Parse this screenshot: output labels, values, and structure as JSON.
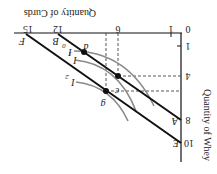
{
  "diagram": {
    "orientation": "rotated-180",
    "x_axis": {
      "title": "Quantity of Curds",
      "ticks": [
        "0",
        "1",
        "6",
        "12",
        "15"
      ]
    },
    "y_axis": {
      "title": "Quantity of Whey",
      "ticks": [
        "1",
        "4",
        "8",
        "10"
      ]
    },
    "budget_lines": [
      {
        "id": "AB",
        "start_label": "A",
        "end_label": "B",
        "whey_intercept": 8,
        "curds_intercept": 12
      },
      {
        "id": "EF",
        "start_label": "E",
        "end_label": "F",
        "whey_intercept": 10,
        "curds_intercept": 15
      }
    ],
    "indifference_curves": [
      {
        "label": "I",
        "sub": "0"
      },
      {
        "label": "I",
        "sub": "1"
      },
      {
        "label": "I",
        "sub": "2"
      }
    ],
    "points": [
      {
        "label": "d"
      },
      {
        "label": "c"
      },
      {
        "label": "g"
      }
    ],
    "colors": {
      "line": "#111111",
      "curve": "#888888",
      "dashed": "#444444"
    }
  }
}
